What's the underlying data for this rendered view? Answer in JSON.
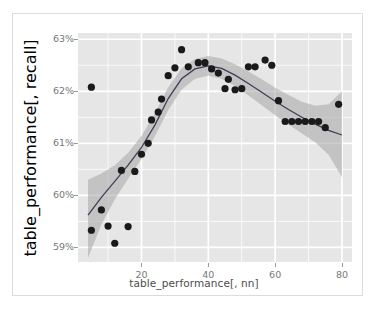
{
  "figure": {
    "background": "#ffffff",
    "border_color": "#dcdcdc",
    "panel_background": "#e6e6e6",
    "grid_color": "#ffffff",
    "point_color": "#1a1a1a",
    "line_color": "#3d3d57",
    "ribbon_color": "#a6a6a6",
    "tick_text_color": "#777777",
    "title_text_color": "#4d4d4d"
  },
  "chart_data": {
    "type": "scatter",
    "title": "",
    "subtitle": "",
    "xlabel": "table_performance[, nn]",
    "ylabel": "table_performance[, recall]",
    "xlim": [
      1,
      83
    ],
    "ylim": [
      58.72,
      63.12
    ],
    "xticks": [
      20,
      40,
      60,
      80
    ],
    "xtick_labels": [
      "20",
      "40",
      "60",
      "80"
    ],
    "yticks": [
      59,
      60,
      61,
      62,
      63
    ],
    "ytick_labels": [
      "59%",
      "60%",
      "61%",
      "62%",
      "63%"
    ],
    "grid": true,
    "grid_major_x": [
      20,
      40,
      60,
      80
    ],
    "grid_major_y": [
      59,
      60,
      61,
      62,
      63
    ],
    "grid_minor_x": [
      10,
      30,
      50,
      70
    ],
    "grid_minor_y": [
      59.5,
      60.5,
      61.5,
      62.5
    ],
    "legend": null,
    "legend_position": "none",
    "annotations": [],
    "series": [
      {
        "name": "recall observations",
        "type": "scatter",
        "marker": "filled-circle",
        "marker_size": 3.6,
        "color": "#1a1a1a",
        "points": [
          {
            "x": 5,
            "y": 59.33
          },
          {
            "x": 5,
            "y": 62.08
          },
          {
            "x": 8,
            "y": 59.72
          },
          {
            "x": 10,
            "y": 59.41
          },
          {
            "x": 12,
            "y": 59.08
          },
          {
            "x": 14,
            "y": 60.48
          },
          {
            "x": 16,
            "y": 59.4
          },
          {
            "x": 18,
            "y": 60.46
          },
          {
            "x": 20,
            "y": 60.79
          },
          {
            "x": 22,
            "y": 61.0
          },
          {
            "x": 23,
            "y": 61.45
          },
          {
            "x": 25,
            "y": 61.6
          },
          {
            "x": 26,
            "y": 61.85
          },
          {
            "x": 28,
            "y": 62.3
          },
          {
            "x": 30,
            "y": 62.45
          },
          {
            "x": 32,
            "y": 62.8
          },
          {
            "x": 34,
            "y": 62.47
          },
          {
            "x": 37,
            "y": 62.55
          },
          {
            "x": 39,
            "y": 62.55
          },
          {
            "x": 41,
            "y": 62.43
          },
          {
            "x": 43,
            "y": 62.35
          },
          {
            "x": 45,
            "y": 62.05
          },
          {
            "x": 46,
            "y": 62.23
          },
          {
            "x": 48,
            "y": 62.03
          },
          {
            "x": 50,
            "y": 62.05
          },
          {
            "x": 52,
            "y": 62.47
          },
          {
            "x": 54,
            "y": 62.47
          },
          {
            "x": 57,
            "y": 62.6
          },
          {
            "x": 59,
            "y": 62.5
          },
          {
            "x": 61,
            "y": 61.82
          },
          {
            "x": 63,
            "y": 61.42
          },
          {
            "x": 65,
            "y": 61.42
          },
          {
            "x": 67,
            "y": 61.42
          },
          {
            "x": 69,
            "y": 61.42
          },
          {
            "x": 71,
            "y": 61.42
          },
          {
            "x": 73,
            "y": 61.42
          },
          {
            "x": 75,
            "y": 61.3
          },
          {
            "x": 79,
            "y": 61.75
          }
        ]
      },
      {
        "name": "smoothed fit",
        "type": "line",
        "color": "#3d3d57",
        "points": [
          {
            "x": 4,
            "y": 59.62
          },
          {
            "x": 8,
            "y": 59.96
          },
          {
            "x": 12,
            "y": 60.27
          },
          {
            "x": 16,
            "y": 60.58
          },
          {
            "x": 20,
            "y": 60.92
          },
          {
            "x": 24,
            "y": 61.35
          },
          {
            "x": 28,
            "y": 61.86
          },
          {
            "x": 32,
            "y": 62.24
          },
          {
            "x": 36,
            "y": 62.43
          },
          {
            "x": 40,
            "y": 62.49
          },
          {
            "x": 44,
            "y": 62.44
          },
          {
            "x": 48,
            "y": 62.31
          },
          {
            "x": 52,
            "y": 62.15
          },
          {
            "x": 56,
            "y": 61.98
          },
          {
            "x": 60,
            "y": 61.81
          },
          {
            "x": 64,
            "y": 61.65
          },
          {
            "x": 68,
            "y": 61.5
          },
          {
            "x": 72,
            "y": 61.37
          },
          {
            "x": 76,
            "y": 61.25
          },
          {
            "x": 80,
            "y": 61.16
          }
        ]
      },
      {
        "name": "confidence band",
        "type": "ribbon",
        "color": "#a6a6a6",
        "opacity": 0.55,
        "upper": [
          {
            "x": 4,
            "y": 60.3
          },
          {
            "x": 8,
            "y": 60.42
          },
          {
            "x": 12,
            "y": 60.58
          },
          {
            "x": 16,
            "y": 60.82
          },
          {
            "x": 20,
            "y": 61.14
          },
          {
            "x": 24,
            "y": 61.58
          },
          {
            "x": 28,
            "y": 62.08
          },
          {
            "x": 32,
            "y": 62.44
          },
          {
            "x": 36,
            "y": 62.62
          },
          {
            "x": 40,
            "y": 62.68
          },
          {
            "x": 44,
            "y": 62.63
          },
          {
            "x": 48,
            "y": 62.52
          },
          {
            "x": 52,
            "y": 62.38
          },
          {
            "x": 56,
            "y": 62.23
          },
          {
            "x": 60,
            "y": 62.07
          },
          {
            "x": 64,
            "y": 61.93
          },
          {
            "x": 68,
            "y": 61.8
          },
          {
            "x": 72,
            "y": 61.72
          },
          {
            "x": 76,
            "y": 61.75
          },
          {
            "x": 80,
            "y": 62.0
          }
        ],
        "lower": [
          {
            "x": 4,
            "y": 58.8
          },
          {
            "x": 8,
            "y": 59.44
          },
          {
            "x": 12,
            "y": 59.92
          },
          {
            "x": 16,
            "y": 60.32
          },
          {
            "x": 20,
            "y": 60.7
          },
          {
            "x": 24,
            "y": 61.13
          },
          {
            "x": 28,
            "y": 61.64
          },
          {
            "x": 32,
            "y": 62.03
          },
          {
            "x": 36,
            "y": 62.24
          },
          {
            "x": 40,
            "y": 62.3
          },
          {
            "x": 44,
            "y": 62.24
          },
          {
            "x": 48,
            "y": 62.1
          },
          {
            "x": 52,
            "y": 61.92
          },
          {
            "x": 56,
            "y": 61.73
          },
          {
            "x": 60,
            "y": 61.54
          },
          {
            "x": 64,
            "y": 61.36
          },
          {
            "x": 68,
            "y": 61.19
          },
          {
            "x": 72,
            "y": 61.02
          },
          {
            "x": 76,
            "y": 60.78
          },
          {
            "x": 80,
            "y": 60.35
          }
        ]
      }
    ]
  }
}
